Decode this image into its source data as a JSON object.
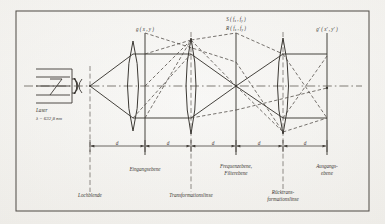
{
  "figure": {
    "kind": "optical-ray-diagram",
    "title_visible": false,
    "border": true,
    "ink_color": "#3c3934",
    "paper_color": "#f4f2ee",
    "axis_style": "dash-dot"
  },
  "source": {
    "label": "Laser",
    "wavelength_label": "λ = 632,8 nm"
  },
  "top_labels": {
    "input_function": "g ( x , y )",
    "spectrum_s": "S ( f",
    "spectrum_s_sub": "x",
    "spectrum_s_mid": " , f",
    "spectrum_s_sub2": "y",
    "spectrum_s_end": " )",
    "filter_r": "R ( f",
    "filter_r_sub": "x",
    "filter_r_mid": " , f",
    "filter_r_sub2": "y",
    "filter_r_end": " )",
    "output_function": "g' ( x' , y' )"
  },
  "bottom_labels": {
    "pinhole": "Lochblende",
    "input_plane": "Eingangsebene",
    "transform_lens": "Transformationslinse",
    "frequency_plane_line1": "Frequenzebene,",
    "frequency_plane_line2": "Filterebene",
    "inverse_lens_line1": "Rücktrans-",
    "inverse_lens_line2": "formationslinse",
    "output_plane_line1": "Ausgangs-",
    "output_plane_line2": "ebene"
  },
  "dimensions": {
    "segment_label": "d",
    "segments": [
      "d",
      "d",
      "d",
      "d",
      "d"
    ],
    "count": 5
  },
  "planes": [
    {
      "name": "pinhole-plane",
      "x": 90
    },
    {
      "name": "input-plane",
      "x": 145
    },
    {
      "name": "frequency-plane",
      "x": 236
    },
    {
      "name": "output-plane",
      "x": 327
    }
  ],
  "lenses": [
    {
      "name": "collimating-transform-lens",
      "x": 133
    },
    {
      "name": "transform-lens",
      "x": 191
    },
    {
      "name": "inverse-transform-lens",
      "x": 283
    }
  ]
}
